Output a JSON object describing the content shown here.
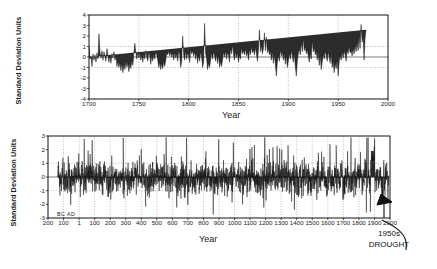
{
  "figure": {
    "background": "#ffffff",
    "ink": "#111111",
    "grid_color": "#7a7a7a",
    "series_fill": "#2c2c2c"
  },
  "chart_data": [
    {
      "id": "top",
      "type": "area",
      "title": "",
      "xlabel": "Year",
      "ylabel": "Standard Deviation Units",
      "xlim": [
        1700,
        2000
      ],
      "ylim": [
        -4,
        4
      ],
      "xticks": [
        1700,
        1750,
        1800,
        1850,
        1900,
        1950,
        2000
      ],
      "xticklabels": [
        "1700",
        "1750",
        "1800",
        "1850",
        "1900",
        "1950",
        "2000"
      ],
      "yticks": [
        -4,
        -3,
        -2,
        -1,
        0,
        1,
        2,
        3,
        4
      ],
      "yticklabels": [
        "-4",
        "-3",
        "-2",
        "-1",
        "0",
        "1",
        "2",
        "3",
        "4"
      ],
      "grid": true,
      "gridlines_h": [
        -1,
        1
      ],
      "zero_line": 0,
      "legend": "none",
      "baseline": 0,
      "x": [
        1700,
        1701,
        1702,
        1703,
        1704,
        1705,
        1706,
        1707,
        1708,
        1709,
        1710,
        1711,
        1712,
        1713,
        1714,
        1715,
        1716,
        1717,
        1718,
        1719,
        1720,
        1721,
        1722,
        1723,
        1724,
        1725,
        1726,
        1727,
        1728,
        1729,
        1730,
        1731,
        1732,
        1733,
        1734,
        1735,
        1736,
        1737,
        1738,
        1739,
        1740,
        1741,
        1742,
        1743,
        1744,
        1745,
        1746,
        1747,
        1748,
        1749,
        1750,
        1751,
        1752,
        1753,
        1754,
        1755,
        1756,
        1757,
        1758,
        1759,
        1760,
        1761,
        1762,
        1763,
        1764,
        1765,
        1766,
        1767,
        1768,
        1769,
        1770,
        1771,
        1772,
        1773,
        1774,
        1775,
        1776,
        1777,
        1778,
        1779,
        1780,
        1781,
        1782,
        1783,
        1784,
        1785,
        1786,
        1787,
        1788,
        1789,
        1790,
        1791,
        1792,
        1793,
        1794,
        1795,
        1796,
        1797,
        1798,
        1799,
        1800,
        1801,
        1802,
        1803,
        1804,
        1805,
        1806,
        1807,
        1808,
        1809,
        1810,
        1811,
        1812,
        1813,
        1814,
        1815,
        1816,
        1817,
        1818,
        1819,
        1820,
        1821,
        1822,
        1823,
        1824,
        1825,
        1826,
        1827,
        1828,
        1829,
        1830,
        1831,
        1832,
        1833,
        1834,
        1835,
        1836,
        1837,
        1838,
        1839,
        1840,
        1841,
        1842,
        1843,
        1844,
        1845,
        1846,
        1847,
        1848,
        1849,
        1850,
        1851,
        1852,
        1853,
        1854,
        1855,
        1856,
        1857,
        1858,
        1859,
        1860,
        1861,
        1862,
        1863,
        1864,
        1865,
        1866,
        1867,
        1868,
        1869,
        1870,
        1871,
        1872,
        1873,
        1874,
        1875,
        1876,
        1877,
        1878,
        1879,
        1880,
        1881,
        1882,
        1883,
        1884,
        1885,
        1886,
        1887,
        1888,
        1889,
        1890,
        1891,
        1892,
        1893,
        1894,
        1895,
        1896,
        1897,
        1898,
        1899,
        1900,
        1901,
        1902,
        1903,
        1904,
        1905,
        1906,
        1907,
        1908,
        1909,
        1910,
        1911,
        1912,
        1913,
        1914,
        1915,
        1916,
        1917,
        1918,
        1919,
        1920,
        1921,
        1922,
        1923,
        1924,
        1925,
        1926,
        1927,
        1928,
        1929,
        1930,
        1931,
        1932,
        1933,
        1934,
        1935,
        1936,
        1937,
        1938,
        1939,
        1940,
        1941,
        1942,
        1943,
        1944,
        1945,
        1946,
        1947,
        1948,
        1949,
        1950,
        1951,
        1952,
        1953,
        1954,
        1955,
        1956,
        1957,
        1958,
        1959,
        1960,
        1961,
        1962,
        1963,
        1964,
        1965,
        1966,
        1967,
        1968,
        1969,
        1970,
        1971,
        1972,
        1973,
        1974,
        1975,
        1976,
        1977,
        1978,
        1979,
        1980,
        1981,
        1982,
        1983,
        1984,
        1985,
        1986,
        1987,
        1988,
        1989,
        1990
      ],
      "y": [
        1.0,
        -0.2,
        0.1,
        -0.9,
        0.3,
        -0.3,
        0.2,
        -0.5,
        0.4,
        -0.2,
        2.2,
        0.5,
        -0.1,
        0.6,
        -0.3,
        0.5,
        0.1,
        -0.4,
        0.8,
        0.1,
        -0.5,
        0.2,
        -0.6,
        0.3,
        -0.1,
        0.5,
        -0.3,
        0.1,
        -0.9,
        -0.4,
        -1.0,
        -0.5,
        -1.3,
        -0.6,
        -1.5,
        -0.7,
        -1.2,
        -0.4,
        -1.0,
        -0.5,
        -1.4,
        -0.6,
        -1.1,
        -0.3,
        -0.8,
        0.3,
        1.3,
        0.4,
        -0.2,
        0.5,
        -0.1,
        0.4,
        -0.3,
        0.2,
        -0.5,
        0.3,
        -0.2,
        0.6,
        0.0,
        -0.4,
        0.5,
        0.1,
        -0.7,
        0.2,
        -0.4,
        0.3,
        -0.2,
        0.5,
        0.2,
        -0.3,
        -1.0,
        -0.5,
        -1.2,
        -0.6,
        -1.1,
        -0.4,
        -0.9,
        -0.3,
        0.4,
        0.2,
        0.6,
        0.1,
        0.5,
        0.0,
        0.4,
        -0.3,
        0.5,
        -0.1,
        0.3,
        -0.4,
        0.6,
        0.2,
        -1.0,
        -0.4,
        2.0,
        0.2,
        -0.3,
        0.6,
        -0.2,
        0.4,
        0.1,
        -0.5,
        0.7,
        0.3,
        0.6,
        0.1,
        0.5,
        -0.2,
        0.4,
        -0.6,
        0.2,
        -0.4,
        0.5,
        0.0,
        -1.0,
        -0.5,
        3.2,
        0.3,
        -0.2,
        -1.2,
        -0.6,
        -1.0,
        -0.3,
        0.4,
        -0.2,
        0.5,
        0.1,
        -0.4,
        0.3,
        -0.6,
        0.2,
        -1.0,
        -0.4,
        -0.9,
        -0.3,
        0.5,
        0.0,
        0.6,
        -0.2,
        0.4,
        0.2,
        -0.5,
        0.8,
        0.3,
        1.2,
        0.2,
        -0.3,
        0.5,
        -0.1,
        0.4,
        -0.5,
        0.2,
        -0.2,
        0.9,
        0.3,
        0.6,
        0.2,
        0.8,
        0.1,
        0.5,
        -0.3,
        0.7,
        0.2,
        1.0,
        0.4,
        0.7,
        0.2,
        0.9,
        0.3,
        -0.4,
        0.6,
        2.6,
        0.5,
        1.1,
        0.3,
        0.8,
        2.3,
        0.6,
        1.9,
        0.4,
        0.8,
        0.2,
        0.6,
        -0.3,
        0.5,
        -0.6,
        0.3,
        -0.8,
        -1.8,
        -0.5,
        0.2,
        -0.4,
        0.7,
        0.1,
        0.5,
        -0.3,
        0.4,
        -0.7,
        0.2,
        -1.0,
        -0.4,
        0.3,
        -0.2,
        0.6,
        0.1,
        -0.5,
        0.4,
        -0.9,
        -1.8,
        -0.4,
        0.3,
        0.8,
        0.2,
        1.4,
        0.5,
        1.8,
        0.6,
        1.0,
        0.3,
        0.7,
        0.1,
        -0.5,
        0.4,
        -0.2,
        1.6,
        0.5,
        0.9,
        0.2,
        0.6,
        -0.3,
        0.5,
        -0.8,
        0.2,
        -1.2,
        -0.5,
        0.3,
        -0.2,
        0.6,
        0.1,
        -0.4,
        0.5,
        0.0,
        -0.6,
        0.3,
        -1.0,
        -0.4,
        -1.5,
        -0.6,
        -1.1,
        -0.3,
        -1.8,
        -0.5,
        0.2,
        -0.3,
        0.5,
        -0.1,
        0.6,
        0.2,
        -0.4,
        0.7,
        0.3,
        1.0,
        0.4,
        0.6,
        0.1,
        0.8,
        0.3,
        1.1,
        0.5,
        1.4,
        0.6,
        2.0,
        0.8,
        3.1,
        1.4,
        2.0,
        -0.3,
        1.8,
        2.6
      ]
    },
    {
      "id": "bottom",
      "type": "area",
      "title": "",
      "xlabel": "Year",
      "ylabel": "Standard Deviation Units",
      "xlim": [
        -200,
        2000
      ],
      "ylim": [
        -3,
        3
      ],
      "xticks": [
        -200,
        -100,
        1,
        100,
        200,
        300,
        400,
        500,
        600,
        700,
        800,
        900,
        1000,
        1100,
        1200,
        1300,
        1400,
        1500,
        1600,
        1700,
        1800,
        1900,
        2000
      ],
      "xticklabels": [
        "200",
        "100",
        "1",
        "100",
        "200",
        "300",
        "400",
        "500",
        "600",
        "700",
        "800",
        "900",
        "1000",
        "1100",
        "1200",
        "1300",
        "1400",
        "1500",
        "1600",
        "1700",
        "1800",
        "1900",
        "2000"
      ],
      "yticks": [
        -3,
        -2,
        -1,
        0,
        1,
        2,
        3
      ],
      "yticklabels": [
        "-3",
        "-2",
        "-1",
        "0",
        "1",
        "2",
        "3"
      ],
      "grid": true,
      "gridlines_h": [
        -1,
        1
      ],
      "zero_line": 0,
      "era_marker": "BC  AD",
      "data_start_year": -137,
      "legend": "none",
      "annotation": {
        "text_line1": "1950s",
        "text_line2": "DROUGHT",
        "points_to_year": 1955
      }
    }
  ],
  "top_chart": {
    "ylabel": "Standard Deviation Units",
    "xlabel": "Year"
  },
  "bottom_chart": {
    "ylabel": "Standard Deviation Units",
    "xlabel": "Year",
    "era_marker": "BC  AD",
    "annotation_line1": "1950s",
    "annotation_line2": "DROUGHT"
  }
}
